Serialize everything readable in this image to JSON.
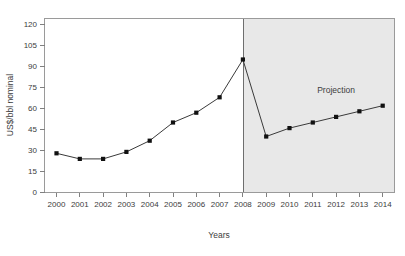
{
  "top_clipped_strip": "· · · · · · ·",
  "chart_data": {
    "type": "line",
    "title": "",
    "xlabel": "Years",
    "ylabel": "US$/bbl nominal",
    "categories": [
      "2000",
      "2001",
      "2002",
      "2003",
      "2004",
      "2005",
      "2006",
      "2007",
      "2008",
      "2009",
      "2010",
      "2011",
      "2012",
      "2013",
      "2014"
    ],
    "values": [
      28,
      24,
      24,
      29,
      37,
      50,
      57,
      68,
      95,
      40,
      46,
      50,
      54,
      58,
      62
    ],
    "series": [
      {
        "name": "US$/bbl nominal",
        "values": [
          28,
          24,
          24,
          29,
          37,
          50,
          57,
          68,
          95,
          40,
          46,
          50,
          54,
          58,
          62
        ]
      }
    ],
    "x_tick_labels": [
      "2000",
      "2001",
      "2002",
      "2003",
      "2004",
      "2005",
      "2006",
      "2007",
      "2008",
      "2009",
      "2010",
      "2011",
      "2012",
      "2013",
      "2014"
    ],
    "y_tick_labels": [
      "0",
      "15",
      "30",
      "45",
      "60",
      "75",
      "90",
      "105",
      "120"
    ],
    "y_ticks": [
      0,
      15,
      30,
      45,
      60,
      75,
      90,
      105,
      120
    ],
    "ylim": [
      0,
      126
    ],
    "xlim_labels": [
      "2000",
      "2014"
    ],
    "grid": false,
    "legend": "none",
    "marker": "square",
    "marker_color": "#111111",
    "line_color": "#3a3a3a",
    "annotations": [
      {
        "text": "Projection",
        "x_category": "2012",
        "y_value": 71,
        "name": "projection-label"
      }
    ],
    "shaded_regions": [
      {
        "name": "projection-band",
        "from_category": "2008",
        "to_category": "2014",
        "color": "#e8e8e8",
        "label": "Projection"
      }
    ],
    "divider": {
      "name": "projection-divider",
      "at_category": "2008",
      "color": "#6e6e6e"
    }
  },
  "axis": {
    "y_title": "US$/bbl nominal",
    "x_title": "Years"
  },
  "colors": {
    "plot_background": "#ffffff",
    "projection_background": "#e8e8e8",
    "axis": "#808080",
    "series": "#111111",
    "text": "#3c3c3c"
  }
}
